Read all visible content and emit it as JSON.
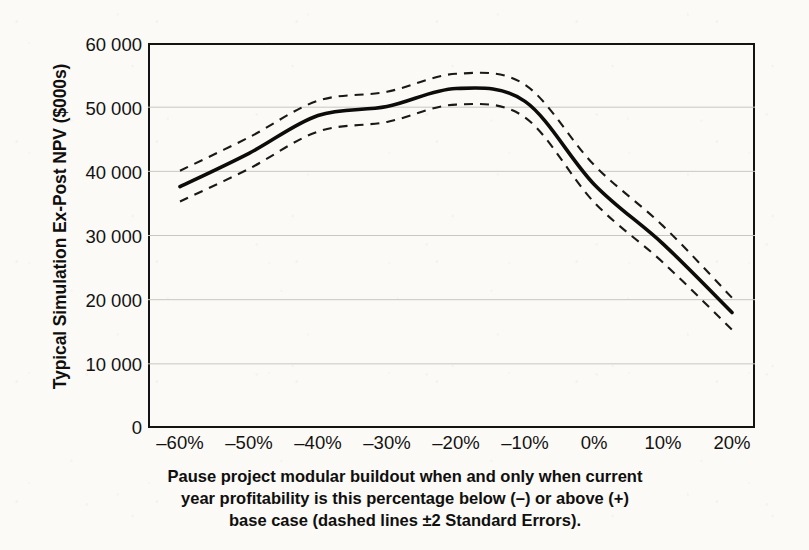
{
  "chart_data": {
    "type": "line",
    "title": "",
    "subtitle": "",
    "xlabel": "Pause project modular buildout when and only when current year profitability is this percentage below (–) or above (+) base case (dashed lines ±2 Standard Errors).",
    "ylabel": "Typical Simulation Ex-Post NPV ($000s)",
    "categories": [
      "–60%",
      "–50%",
      "–40%",
      "–30%",
      "–20%",
      "–10%",
      "0%",
      "10%",
      "20%"
    ],
    "x": [
      -60,
      -50,
      -40,
      -30,
      -20,
      -10,
      0,
      10,
      20
    ],
    "xlim": [
      -60,
      20
    ],
    "ylim": [
      0,
      60000
    ],
    "ytick_labels": [
      "0",
      "10 000",
      "20 000",
      "30 000",
      "40 000",
      "50 000",
      "60 000"
    ],
    "ytick_values": [
      0,
      10000,
      20000,
      30000,
      40000,
      50000,
      60000
    ],
    "grid": "horizontal",
    "legend": "none",
    "series": [
      {
        "name": "Typical Simulation Ex-Post NPV",
        "style": "solid",
        "values": [
          37600,
          42800,
          48700,
          50100,
          52900,
          50900,
          38000,
          28700,
          18000
        ]
      },
      {
        "name": "Upper bound (+2 Standard Errors)",
        "style": "dashed",
        "values": [
          40100,
          45300,
          51000,
          52400,
          55200,
          53500,
          41000,
          31500,
          20300
        ]
      },
      {
        "name": "Lower bound (−2 Standard Errors)",
        "style": "dashed",
        "values": [
          35300,
          40400,
          46200,
          47700,
          50400,
          48400,
          35200,
          25800,
          15300
        ]
      }
    ]
  },
  "axes": {
    "y_title": "Typical Simulation Ex-Post NPV ($000s)",
    "y_ticks": [
      "60 000",
      "50 000",
      "40 000",
      "30 000",
      "20 000",
      "10 000",
      "0"
    ],
    "x_ticks": [
      "–60%",
      "–50%",
      "–40%",
      "–30%",
      "–20%",
      "–10%",
      "0%",
      "10%",
      "20%"
    ]
  },
  "caption": {
    "line1": "Pause project modular buildout when and only when current",
    "line2": "year profitability is this percentage below (–) or above (+)",
    "line3": "base case (dashed lines ±2 Standard Errors)."
  },
  "colors": {
    "ink": "#141312",
    "grid": "#c9c6c0",
    "paper": "#fbfaf7"
  }
}
